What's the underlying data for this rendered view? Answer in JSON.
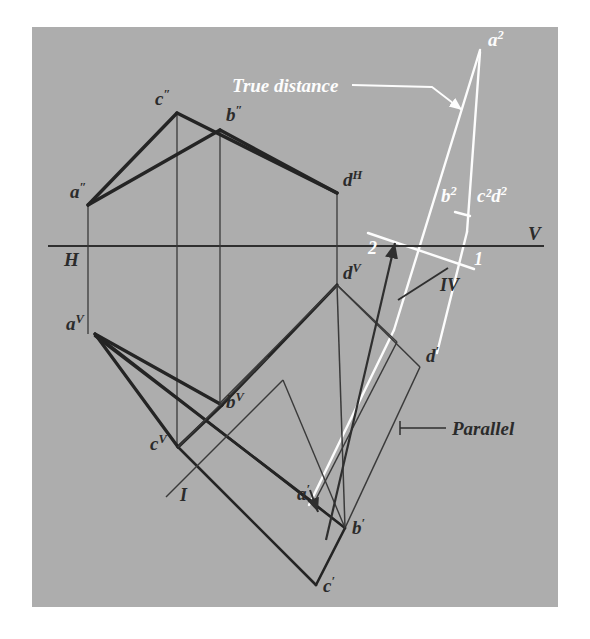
{
  "figure": {
    "background_color": "#ffffff",
    "panel_color": "#adadad",
    "dark_line_color": "#2f2f2f",
    "white_line_color": "#fdfdfd",
    "panel": {
      "x": 32,
      "y": 27,
      "width": 526,
      "height": 580
    }
  },
  "annotations": {
    "true_distance": "True distance",
    "parallel": "Parallel"
  },
  "reference_line_labels": {
    "horizontal_left": "H",
    "horizontal_right": "V",
    "fold_1": "1",
    "fold_2": "2",
    "fold_I": "I",
    "fold_IV": "IV"
  },
  "points": [
    {
      "id": "a-h",
      "base": "a",
      "sup": "″",
      "color": "dark",
      "x": 88,
      "y": 204,
      "label_dx": -18,
      "label_dy": -6
    },
    {
      "id": "c-h",
      "base": "c",
      "sup": "″",
      "color": "dark",
      "x": 177,
      "y": 113,
      "label_dx": -22,
      "label_dy": -8
    },
    {
      "id": "b-h",
      "base": "b",
      "sup": "″",
      "color": "dark",
      "x": 220,
      "y": 129,
      "label_dx": 6,
      "label_dy": -8
    },
    {
      "id": "d-h",
      "base": "d",
      "sup": "H",
      "color": "dark",
      "x": 337,
      "y": 192,
      "label_dx": 6,
      "label_dy": -6
    },
    {
      "id": "a-v",
      "base": "a",
      "sup": "V",
      "color": "dark",
      "x": 95,
      "y": 334,
      "label_dx": -22,
      "label_dy": -4
    },
    {
      "id": "b-v",
      "base": "b",
      "sup": "V",
      "color": "dark",
      "x": 219,
      "y": 404,
      "label_dx": 6,
      "label_dy": 4
    },
    {
      "id": "c-v",
      "base": "c",
      "sup": "V",
      "color": "dark",
      "x": 177,
      "y": 446,
      "label_dx": -24,
      "label_dy": 3
    },
    {
      "id": "d-v",
      "base": "d",
      "sup": "V",
      "color": "dark",
      "x": 337,
      "y": 284,
      "label_dx": 6,
      "label_dy": -5
    },
    {
      "id": "a-p",
      "base": "a",
      "sup": "′",
      "color": "dark",
      "x": 314,
      "y": 502,
      "label_dx": -14,
      "label_dy": -4
    },
    {
      "id": "b-p",
      "base": "b",
      "sup": "′",
      "color": "dark",
      "x": 343,
      "y": 527,
      "label_dx": 10,
      "label_dy": 6
    },
    {
      "id": "c-p",
      "base": "c",
      "sup": "′",
      "color": "dark",
      "x": 314,
      "y": 582,
      "label_dx": 10,
      "label_dy": 8
    },
    {
      "id": "d-p",
      "base": "d",
      "sup": "′",
      "color": "dark",
      "x": 420,
      "y": 366,
      "label_dx": 6,
      "label_dy": -4
    },
    {
      "id": "a-2",
      "base": "a",
      "sup": "2",
      "color": "white",
      "x": 480,
      "y": 50,
      "label_dx": 8,
      "label_dy": -4
    },
    {
      "id": "b-2",
      "base": "b",
      "sup": "2",
      "color": "white",
      "x": 455,
      "y": 205,
      "label_dx": -8,
      "label_dy": -4
    },
    {
      "id": "cd-2",
      "base": "c²d",
      "sup": "2",
      "color": "white",
      "x": 488,
      "y": 205,
      "label_dx": 0,
      "label_dy": -4
    }
  ],
  "geometry": {
    "horizontal_reference_line": {
      "x1": 48,
      "y1": 246,
      "x2": 544,
      "y2": 246
    },
    "fold_line_1_2": {
      "x1": 368,
      "y1": 234,
      "x2": 470,
      "y2": 268
    },
    "fold_line_I_IV": {
      "x1": 412,
      "y1": 292,
      "x2": 470,
      "y2": 268
    },
    "top_view_outline": [
      [
        88,
        204
      ],
      [
        177,
        113
      ],
      [
        220,
        129
      ],
      [
        337,
        192
      ]
    ],
    "vertical_projectors": [
      {
        "x1": 88,
        "y1": 204,
        "x2": 88,
        "y2": 334
      },
      {
        "x1": 177,
        "y1": 113,
        "x2": 177,
        "y2": 446
      },
      {
        "x1": 220,
        "y1": 129,
        "x2": 220,
        "y2": 404
      },
      {
        "x1": 337,
        "y1": 192,
        "x2": 337,
        "y2": 284
      }
    ],
    "front_view_outline": [
      [
        95,
        334
      ],
      [
        219,
        404
      ],
      [
        177,
        446
      ],
      [
        337,
        284
      ]
    ],
    "auxiliary_triangle": [
      [
        480,
        50
      ],
      [
        455,
        212
      ],
      [
        478,
        215
      ]
    ]
  },
  "leaders": {
    "true_distance_leader": {
      "x1": 352,
      "y1": 85,
      "x2": 430,
      "y2": 86,
      "tip_x": 462,
      "tip_y": 108
    },
    "parallel_leader": {
      "x1": 404,
      "y1": 428,
      "x2": 444,
      "y2": 428
    }
  }
}
